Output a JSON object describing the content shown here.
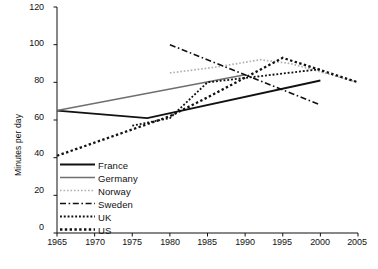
{
  "chart_data": {
    "type": "line",
    "title": "",
    "xlabel": "",
    "ylabel": "Minutes per day",
    "xlim": [
      1965,
      2005
    ],
    "ylim": [
      0,
      120
    ],
    "ytick_values": [
      0,
      20,
      40,
      60,
      80,
      100,
      120
    ],
    "ytick_labels": [
      "0",
      "20",
      "40",
      "60",
      "80",
      "100",
      "120"
    ],
    "xtick_values": [
      1965,
      1970,
      1975,
      1980,
      1985,
      1990,
      1995,
      2000,
      2005
    ],
    "xtick_labels": [
      "1965",
      "1970",
      "1975",
      "1980",
      "1985",
      "1990",
      "1995",
      "2000",
      "2005"
    ],
    "grid": false,
    "legend_position": "lower-left-inside",
    "series": [
      {
        "name": "France",
        "style": "solid-thick-black",
        "color": "#111111",
        "points": [
          [
            1965,
            65
          ],
          [
            1977,
            61
          ],
          [
            2000,
            81
          ]
        ]
      },
      {
        "name": "Germany",
        "style": "solid-gray",
        "color": "#6f6f6f",
        "points": [
          [
            1965,
            65
          ],
          [
            1990,
            84
          ]
        ]
      },
      {
        "name": "Norway",
        "style": "fine-light-dotted",
        "color": "#b5b5b5",
        "points": [
          [
            1980,
            85
          ],
          [
            1986,
            88
          ],
          [
            1992,
            92
          ],
          [
            1996,
            90
          ],
          [
            2005,
            80
          ]
        ]
      },
      {
        "name": "Sweden",
        "style": "dash-dot",
        "color": "#111111",
        "points": [
          [
            1980,
            100
          ],
          [
            2000,
            68
          ]
        ]
      },
      {
        "name": "UK",
        "style": "small-dotted",
        "color": "#111111",
        "points": [
          [
            1975,
            57
          ],
          [
            1980,
            61
          ],
          [
            1985,
            80
          ],
          [
            2000,
            87
          ]
        ]
      },
      {
        "name": "US",
        "style": "large-dotted",
        "color": "#111111",
        "points": [
          [
            1965,
            41
          ],
          [
            1980,
            62
          ],
          [
            1985,
            72
          ],
          [
            1995,
            93
          ],
          [
            2005,
            80
          ]
        ]
      }
    ],
    "legend_entries": [
      {
        "label": "France",
        "style": "solid-thick-black"
      },
      {
        "label": "Germany",
        "style": "solid-gray"
      },
      {
        "label": "Norway",
        "style": "fine-light-dotted"
      },
      {
        "label": "Sweden",
        "style": "dash-dot"
      },
      {
        "label": "UK",
        "style": "small-dotted"
      },
      {
        "label": "US",
        "style": "large-dotted"
      }
    ]
  },
  "caption": {
    "text": ""
  }
}
